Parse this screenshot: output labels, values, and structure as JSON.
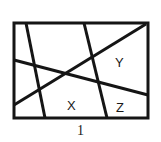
{
  "figure": {
    "caption": "1",
    "background_color": "#ffffff",
    "stroke_color": "#151515",
    "label_color": "#1a1a1a",
    "border": {
      "name": "rectangle-border",
      "x": 14,
      "y": 23,
      "width": 134,
      "height": 95,
      "stroke_width": 3
    },
    "lines": [
      {
        "name": "line-a-steep-left",
        "description": "steep line from top edge down to bottom edge on the left",
        "x1": 26,
        "y1": 23,
        "x2": 45,
        "y2": 118,
        "stroke_width": 3
      },
      {
        "name": "line-b-steep-center",
        "description": "steep line from top edge down to bottom edge near center-right",
        "x1": 84,
        "y1": 23,
        "x2": 107,
        "y2": 118,
        "stroke_width": 3
      },
      {
        "name": "line-c-near-horizontal",
        "description": "gently descending line from left edge to right edge",
        "x1": 14,
        "y1": 60,
        "x2": 148,
        "y2": 95,
        "stroke_width": 3
      },
      {
        "name": "line-d-long-diagonal",
        "description": "rising diagonal from lower-left edge to upper-right corner region",
        "x1": 14,
        "y1": 105,
        "x2": 146,
        "y2": 24,
        "stroke_width": 3
      }
    ],
    "labels": [
      {
        "name": "region-label-x",
        "text": "X",
        "x": 67,
        "y": 99
      },
      {
        "name": "region-label-y",
        "text": "Y",
        "x": 115,
        "y": 56
      },
      {
        "name": "region-label-z",
        "text": "Z",
        "x": 116,
        "y": 101
      }
    ]
  }
}
